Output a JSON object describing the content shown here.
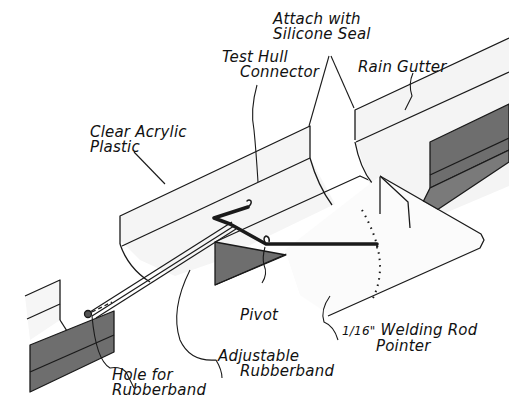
{
  "diagram": {
    "type": "technical-illustration",
    "colors": {
      "line": "#1a1a1a",
      "panel_fill": "#f4f4f4",
      "shadow_fill": "#6e6e6e",
      "background": "#ffffff"
    },
    "labels": {
      "attach": {
        "line1": "Attach with",
        "line2": "Silicone Seal"
      },
      "connector": {
        "line1": "Test Hull",
        "line2": "Connector"
      },
      "gutter": {
        "line1": "Rain Gutter"
      },
      "acrylic": {
        "line1": "Clear Acrylic",
        "line2": "Plastic"
      },
      "pivot": {
        "line1": "Pivot"
      },
      "pointer": {
        "fraction": "1/16\"",
        "line1": "Welding Rod",
        "line2": "Pointer"
      },
      "adjustable": {
        "line1": "Adjustable",
        "line2": "Rubberband"
      },
      "hole": {
        "line1": "Hole for",
        "line2": "Rubberband"
      }
    }
  }
}
